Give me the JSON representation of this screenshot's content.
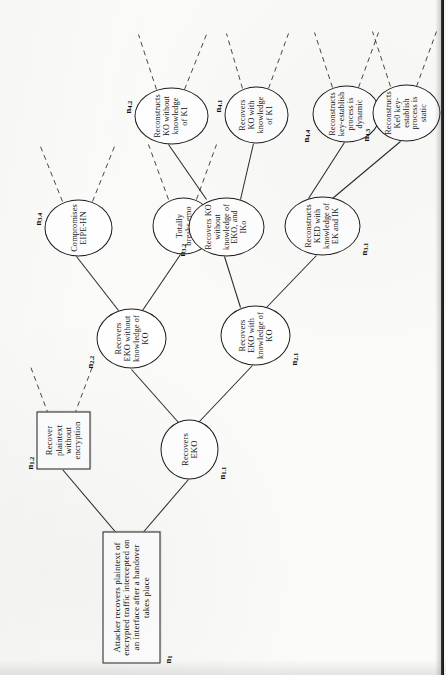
{
  "figure": {
    "type": "attack-tree",
    "orientation": "rotated-90-ccw-on-page",
    "root": {
      "id": "n1",
      "tag": "n",
      "tag_sub": "1",
      "shape": "rectangle",
      "label": "Attacker recovers plaintext of encrypted traffic intercepted on an interface after a handover takes place"
    },
    "nodes": [
      {
        "id": "n1_2",
        "tag": "n",
        "tag_sub": "1.2",
        "shape": "rectangle",
        "label": "Recover plaintext without encryption",
        "parent": "n1",
        "children_stubs": 2
      },
      {
        "id": "n1_1",
        "tag": "n",
        "tag_sub": "1.1",
        "shape": "ellipse",
        "label": "Recovers EKO",
        "parent": "n1",
        "children_stubs": 0
      },
      {
        "id": "n2_2",
        "tag": "n",
        "tag_sub": "2.2",
        "shape": "ellipse",
        "label": "Recovers EKO without knowledge of KO",
        "parent": "n1_1",
        "children_stubs": 0
      },
      {
        "id": "n2_1",
        "tag": "n",
        "tag_sub": "2.1",
        "shape": "ellipse",
        "label": "Recovers EKO with knowledge of KO",
        "parent": "n1_1",
        "children_stubs": 0
      },
      {
        "id": "n3_4",
        "tag": "n",
        "tag_sub": "3.4",
        "shape": "ellipse",
        "label": "Compromises EIPE-HN",
        "parent": "n2_2",
        "children_stubs": 2
      },
      {
        "id": "n3_3",
        "tag": "n",
        "tag_sub": "3.3",
        "shape": "ellipse",
        "label": "Totally breaks emo",
        "parent": "n2_2",
        "children_stubs": 2
      },
      {
        "id": "n3_2",
        "tag": "n",
        "tag_sub": "3.2",
        "shape": "ellipse",
        "label": "Recovers KO without knowledge of EKO, and IKo",
        "parent": "n2_1",
        "children_stubs": 0
      },
      {
        "id": "n3_1",
        "tag": "n",
        "tag_sub": "3.1",
        "shape": "ellipse",
        "label": "Reconstructs KED with knowledge of EK and IK",
        "parent": "n2_1",
        "children_stubs": 0
      },
      {
        "id": "n4_2",
        "tag": "n",
        "tag_sub": "4.2",
        "shape": "ellipse",
        "label": "Reconstructs KO without knowledge of K1",
        "parent": "n3_2",
        "children_stubs": 2
      },
      {
        "id": "n4_1",
        "tag": "n",
        "tag_sub": "4.1",
        "shape": "ellipse",
        "label": "Recovers KO with knowledge of K1",
        "parent": "n3_2",
        "children_stubs": 2
      },
      {
        "id": "n4_4",
        "tag": "n",
        "tag_sub": "4.4",
        "shape": "ellipse",
        "label": "Reconstructs key-establish process is dynamic",
        "parent": "n3_1",
        "children_stubs": 2
      },
      {
        "id": "n4_3",
        "tag": "n",
        "tag_sub": "4.3",
        "shape": "ellipse",
        "label": "Reconstructs Ke0 key-establish process is static",
        "parent": "n3_1",
        "children_stubs": 2
      }
    ]
  }
}
